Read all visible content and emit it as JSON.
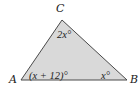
{
  "figure": {
    "type": "triangle",
    "fill_color": "#d9d9d9",
    "stroke_color": "#4a4a4a",
    "vertices": [
      {
        "name": "A",
        "label": "A",
        "x": 21,
        "y": 80
      },
      {
        "name": "B",
        "label": "B",
        "x": 127,
        "y": 80
      },
      {
        "name": "C",
        "label": "C",
        "x": 62,
        "y": 20
      }
    ],
    "angles": {
      "A": "(x + 12)°",
      "B": "x°",
      "C": "2x°"
    }
  }
}
